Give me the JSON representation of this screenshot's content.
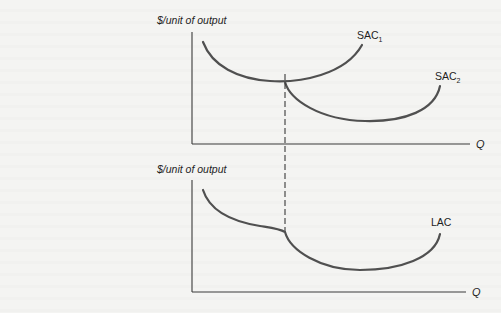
{
  "diagram": {
    "type": "cost-curves",
    "top_panel": {
      "y_axis_label": "$/unit of output",
      "x_axis_label": "Q",
      "curves": [
        {
          "name": "SAC",
          "subscript": "1",
          "label": "SAC1"
        },
        {
          "name": "SAC",
          "subscript": "2",
          "label": "SAC2"
        }
      ]
    },
    "bottom_panel": {
      "y_axis_label": "$/unit of output",
      "x_axis_label": "Q",
      "curves": [
        {
          "name": "LAC",
          "label": "LAC"
        }
      ]
    },
    "connector": {
      "style": "dashed",
      "description": "vertical dashed line from SAC1/SAC2 intersection down to kink in LAC"
    }
  },
  "colors": {
    "curve": "#505050",
    "axis": "#3a3a3a",
    "background": "#f4f4f2"
  }
}
